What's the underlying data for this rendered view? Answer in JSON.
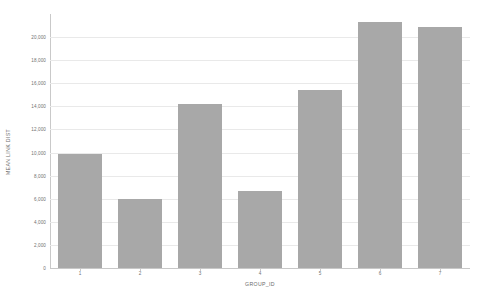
{
  "chart_data": {
    "type": "bar",
    "title": "",
    "subtitle": "",
    "xlabel": "GROUP_ID",
    "ylabel": "MEAN LINK DIST",
    "categories": [
      "1",
      "2",
      "3",
      "4",
      "5",
      "6",
      "7"
    ],
    "values": [
      9900,
      5950,
      14200,
      6700,
      15400,
      21300,
      20900
    ],
    "ylim": [
      0,
      22000
    ],
    "ytick_values": [
      0,
      2000,
      4000,
      6000,
      8000,
      10000,
      12000,
      14000,
      16000,
      18000,
      20000
    ],
    "ytick_labels": [
      "0",
      "2,000",
      "4,000",
      "6,000",
      "8,000",
      "10,000",
      "12,000",
      "14,000",
      "16,000",
      "18,000",
      "20,000"
    ],
    "grid": true,
    "legend": false,
    "legend_position": "none",
    "bar_color": "#a8a8a8",
    "gridline_color": "#e9e9e9",
    "axis_color": "#c9c9c9",
    "background_color": "#ffffff"
  }
}
